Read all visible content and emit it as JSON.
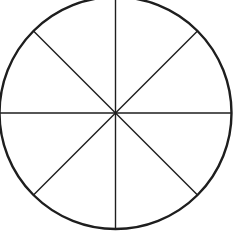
{
  "diagram": {
    "type": "divided-circle",
    "shape": "circle",
    "sections": 8,
    "division_lines": 4,
    "line_angles_deg": [
      0,
      45,
      90,
      135
    ],
    "center": {
      "x": 115.5,
      "y": 113
    },
    "radius": 116,
    "stroke_color": "#1e1e1e",
    "outline_width": 2.4,
    "divider_width": 1.4,
    "background": "#ffffff"
  }
}
